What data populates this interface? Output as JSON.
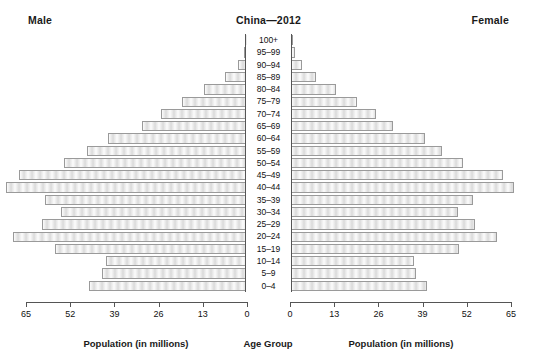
{
  "header": {
    "male_label": "Male",
    "female_label": "Female",
    "title": "China—2012"
  },
  "captions": {
    "left": "Population (in millions)",
    "center": "Age Group",
    "right": "Population (in millions)"
  },
  "chart_data": {
    "type": "bar",
    "subtype": "population-pyramid",
    "title": "China—2012",
    "xlabel": "Population (in millions)",
    "ylabel": "Age Group",
    "grid": false,
    "legend": null,
    "orientation": "horizontal",
    "xlim_left": [
      65,
      0
    ],
    "xlim_right": [
      0,
      65
    ],
    "xticks_left": [
      "65",
      "52",
      "39",
      "26",
      "13",
      "0"
    ],
    "xticks_right": [
      "0",
      "13",
      "26",
      "39",
      "52",
      "65"
    ],
    "xtick_values_left": [
      65,
      52,
      39,
      26,
      13,
      0
    ],
    "xtick_values_right": [
      0,
      13,
      26,
      39,
      52,
      65
    ],
    "axis_max": 65,
    "categories": [
      "0–4",
      "5–9",
      "10–14",
      "15–19",
      "20–24",
      "25–29",
      "30–34",
      "35–39",
      "40–44",
      "45–49",
      "50–54",
      "55–59",
      "60–64",
      "65–69",
      "70–74",
      "75–79",
      "80–84",
      "85–89",
      "90–94",
      "95–99",
      "100+"
    ],
    "series": [
      {
        "name": "Male",
        "side": "left",
        "values": [
          41.5,
          38.0,
          37.0,
          50.5,
          61.5,
          54.0,
          49.0,
          53.0,
          63.5,
          60.0,
          48.0,
          42.0,
          36.5,
          27.5,
          22.5,
          17.0,
          11.0,
          5.5,
          2.0,
          0.6,
          0.1
        ]
      },
      {
        "name": "Female",
        "side": "right",
        "values": [
          36.0,
          33.0,
          32.5,
          44.5,
          54.5,
          48.5,
          44.0,
          48.0,
          59.0,
          56.0,
          45.5,
          40.0,
          35.5,
          27.0,
          22.5,
          17.5,
          12.0,
          6.5,
          2.8,
          1.0,
          0.2
        ]
      }
    ],
    "colors": {
      "bar_fill": "#e9e9e9",
      "bar_border": "#9a9a9a",
      "axis": "#555555",
      "text": "#111111",
      "background": "#ffffff"
    }
  }
}
